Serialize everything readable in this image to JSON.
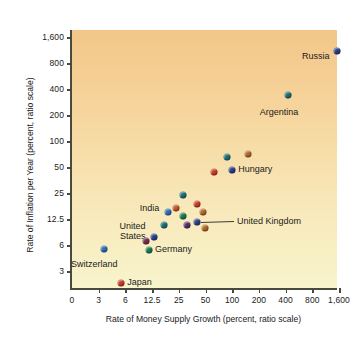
{
  "chart_data": {
    "type": "scatter",
    "title": "",
    "xlabel": "Rate of Money Supply Growth (percent, ratio scale)",
    "ylabel": "Rate of Inflation per Year (percent, ratio scale)",
    "xscale": "log",
    "yscale": "log",
    "grid": false,
    "legend": "none",
    "xticks": [
      "0",
      "3",
      "6",
      "12.5",
      "25",
      "50",
      "100",
      "200",
      "400",
      "800",
      "1,600"
    ],
    "yticks": [
      "3",
      "6",
      "12.5",
      "25",
      "50",
      "100",
      "200",
      "400",
      "800",
      "1,600"
    ],
    "xlim": [
      0,
      1600
    ],
    "ylim": [
      3,
      1600
    ],
    "points": [
      {
        "label": "Russia",
        "x": 1500,
        "y": 1100,
        "color": "#2b3f8c",
        "label_pos": "left"
      },
      {
        "label": "Argentina",
        "x": 430,
        "y": 340,
        "color": "#1b6f74",
        "label_pos": "below-left"
      },
      {
        "label": "",
        "x": 150,
        "y": 72,
        "color": "#b3682c",
        "label_pos": "none"
      },
      {
        "label": "",
        "x": 88,
        "y": 65,
        "color": "#1b6f74",
        "label_pos": "none"
      },
      {
        "label": "Hungary",
        "x": 100,
        "y": 47,
        "color": "#2b3f8c",
        "label_pos": "right"
      },
      {
        "label": "",
        "x": 62,
        "y": 44,
        "color": "#cc3b28",
        "label_pos": "none"
      },
      {
        "label": "",
        "x": 28,
        "y": 24,
        "color": "#1b6f74",
        "label_pos": "none"
      },
      {
        "label": "",
        "x": 40,
        "y": 19,
        "color": "#cc3b28",
        "label_pos": "none"
      },
      {
        "label": "",
        "x": 23,
        "y": 17,
        "color": "#c4562c",
        "label_pos": "none"
      },
      {
        "label": "India",
        "x": 19,
        "y": 15,
        "color": "#2f6fb5",
        "label_pos": "left"
      },
      {
        "label": "",
        "x": 47,
        "y": 15,
        "color": "#b3682c",
        "label_pos": "none"
      },
      {
        "label": "",
        "x": 28,
        "y": 13.5,
        "color": "#1b7a52",
        "label_pos": "none"
      },
      {
        "label": "United Kingdom",
        "x": 40,
        "y": 11.5,
        "color": "#2b3f8c",
        "label_pos": "leader"
      },
      {
        "label": "",
        "x": 31,
        "y": 10.5,
        "color": "#5a2f6b",
        "label_pos": "none"
      },
      {
        "label": "",
        "x": 17,
        "y": 10.5,
        "color": "#1b6f74",
        "label_pos": "none"
      },
      {
        "label": "",
        "x": 49,
        "y": 9.7,
        "color": "#b3682c",
        "label_pos": "none"
      },
      {
        "label": "United States",
        "x": 13,
        "y": 7.5,
        "color": "#2b3f8c",
        "label_pos": "left2"
      },
      {
        "label": "",
        "x": 10.5,
        "y": 6.7,
        "color": "#7a2b4a",
        "label_pos": "none"
      },
      {
        "label": "Germany",
        "x": 11.5,
        "y": 5.3,
        "color": "#1b7a52",
        "label_pos": "right"
      },
      {
        "label": "Switzerland",
        "x": 3.4,
        "y": 5.4,
        "color": "#2f6fb5",
        "label_pos": "below-left"
      },
      {
        "label": "Japan",
        "x": 5.4,
        "y": 2.2,
        "color": "#cc3b28",
        "label_pos": "right"
      }
    ]
  },
  "labels": {
    "russia": "Russia",
    "argentina": "Argentina",
    "hungary": "Hungary",
    "india": "India",
    "united_kingdom": "United Kingdom",
    "united": "United",
    "states": "States",
    "germany": "Germany",
    "switzerland": "Switzerland",
    "japan": "Japan"
  },
  "colors": {
    "background_top": "#f3c689",
    "background_bottom": "#f8f4cc",
    "axis": "#4a4a3c",
    "text": "#1a1a1a"
  }
}
